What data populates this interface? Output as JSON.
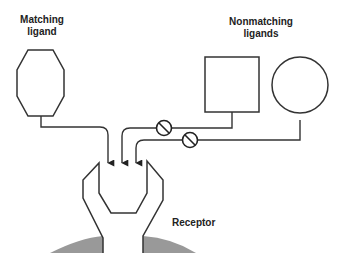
{
  "labels": {
    "matching_line1": "Matching",
    "matching_line2": "ligand",
    "nonmatching_line1": "Nonmatching",
    "nonmatching_line2": "ligands",
    "receptor": "Receptor"
  },
  "colors": {
    "stroke": "#333333",
    "membrane": "#999999",
    "background": "#ffffff"
  },
  "symbols": {
    "blocked": "circle-slash"
  }
}
